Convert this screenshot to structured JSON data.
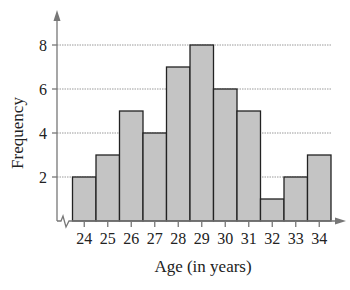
{
  "chart_data": {
    "type": "bar",
    "subtype": "histogram",
    "title": "",
    "xlabel": "Age (in years)",
    "ylabel": "Frequency",
    "categories": [
      "24",
      "25",
      "26",
      "27",
      "28",
      "29",
      "30",
      "31",
      "32",
      "33",
      "34"
    ],
    "values": [
      2,
      3,
      5,
      4,
      7,
      8,
      6,
      5,
      1,
      2,
      3
    ],
    "y_ticks": [
      2,
      4,
      6,
      8
    ],
    "ylim": [
      0,
      8.9
    ],
    "grid": {
      "horizontal": true,
      "style": "dotted",
      "at": [
        2,
        4,
        6,
        8
      ]
    },
    "x_axis_break": true,
    "legend": null,
    "colors": {
      "bar_fill": "#c4c4c4",
      "bar_stroke": "#222222",
      "axis": "#777777",
      "grid": "#9a9a9a",
      "text": "#222222"
    }
  }
}
